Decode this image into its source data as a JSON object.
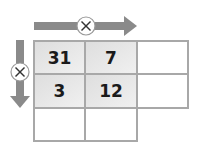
{
  "diagram": {
    "type": "multiplication-grid",
    "operator_symbol": "×",
    "horizontal_arrow": {
      "direction": "right",
      "operator": "×"
    },
    "vertical_arrow": {
      "direction": "down",
      "operator": "×"
    },
    "grid": {
      "rows": [
        [
          "31",
          "7",
          ""
        ],
        [
          "3",
          "12",
          ""
        ],
        [
          "",
          "",
          null
        ]
      ]
    },
    "colors": {
      "arrow": "#8a8a8a",
      "cell_border": "#a8a8a8",
      "filled_cell": "#e6e6e6",
      "text": "#1a1a1a"
    }
  }
}
